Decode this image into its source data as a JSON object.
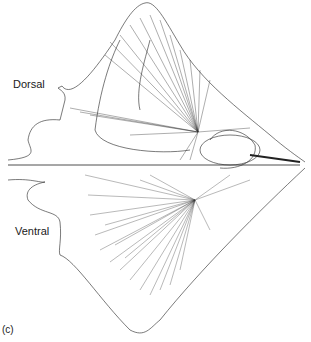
{
  "figure": {
    "panel_label": "(c)",
    "labels": {
      "dorsal": "Dorsal",
      "ventral": "Ventral"
    },
    "colors": {
      "line": "#222222",
      "background": "#ffffff"
    }
  }
}
